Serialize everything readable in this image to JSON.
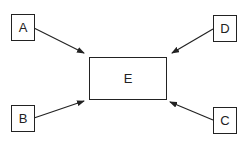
{
  "diagram": {
    "type": "hub-and-spoke",
    "colors": {
      "stroke": "#222222",
      "background": "#ffffff",
      "text": "#222222"
    },
    "center": {
      "id": "E",
      "label": "E"
    },
    "nodes": [
      {
        "id": "A",
        "label": "A",
        "position": "top-left"
      },
      {
        "id": "D",
        "label": "D",
        "position": "top-right"
      },
      {
        "id": "B",
        "label": "B",
        "position": "bottom-left"
      },
      {
        "id": "C",
        "label": "C",
        "position": "bottom-right"
      }
    ],
    "edges": [
      {
        "from": "A",
        "to": "E"
      },
      {
        "from": "D",
        "to": "E"
      },
      {
        "from": "B",
        "to": "E"
      },
      {
        "from": "C",
        "to": "E"
      }
    ]
  }
}
